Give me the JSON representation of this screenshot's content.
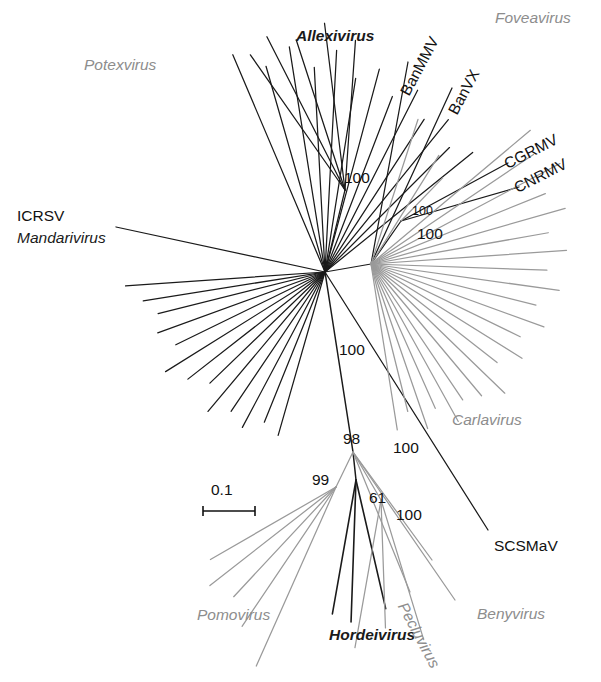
{
  "figure": {
    "type": "unrooted-phylogenetic-tree",
    "background_color": "#ffffff",
    "black_color": "#1a1a1a",
    "gray_color": "#9a9a9a"
  },
  "scale_bar": {
    "label": "0.1",
    "length_px": 52
  },
  "genus_labels": [
    {
      "text": "Potexvirus",
      "color": "#8d8d8d",
      "x": 84,
      "y": 57,
      "style": "italic-gray"
    },
    {
      "text": "Allexivirus",
      "color": "#1a1a1a",
      "x": 296,
      "y": 28,
      "style": "italic-black"
    },
    {
      "text": "Foveavirus",
      "color": "#8d8d8d",
      "x": 495,
      "y": 10,
      "style": "italic-gray"
    },
    {
      "text": "Mandarivirus",
      "color": "#1a1a1a",
      "x": 17,
      "y": 234,
      "style": "italic-black"
    },
    {
      "text": "Carlavirus",
      "color": "#8d8d8d",
      "x": 452,
      "y": 415,
      "style": "italic-gray"
    },
    {
      "text": "Pomovirus",
      "color": "#8d8d8d",
      "x": 197,
      "y": 609,
      "style": "italic-gray"
    },
    {
      "text": "Hordeivirus",
      "color": "#1a1a1a",
      "x": 329,
      "y": 629,
      "style": "italic-black"
    },
    {
      "text": "Pecluvirus",
      "color": "#8d8d8d",
      "x": 417,
      "y": 607,
      "style": "italic-gray-rot"
    },
    {
      "text": "Benyvirus",
      "color": "#8d8d8d",
      "x": 484,
      "y": 608,
      "style": "italic-gray"
    }
  ],
  "species_labels": [
    {
      "text": "BanMMV",
      "x": 416,
      "y": 82,
      "rotated": true
    },
    {
      "text": "BanVX",
      "x": 462,
      "y": 103,
      "rotated": true
    },
    {
      "text": "CGRMV",
      "x": 511,
      "y": 157,
      "rotated": true
    },
    {
      "text": "CNRMV",
      "x": 521,
      "y": 180,
      "rotated": true
    },
    {
      "text": "ICRSV",
      "x": 17,
      "y": 213,
      "rotated": false
    },
    {
      "text": "SCSMaV",
      "x": 494,
      "y": 541,
      "rotated": false
    }
  ],
  "bootstrap_values": [
    {
      "value": "100",
      "x": 344,
      "y": 170,
      "size": "normal"
    },
    {
      "value": "100",
      "x": 412,
      "y": 205,
      "size": "small"
    },
    {
      "value": "100",
      "x": 417,
      "y": 228,
      "size": "normal"
    },
    {
      "value": "100",
      "x": 339,
      "y": 344,
      "size": "normal"
    },
    {
      "value": "98",
      "x": 345,
      "y": 433,
      "size": "normal"
    },
    {
      "value": "100",
      "x": 395,
      "y": 442,
      "size": "normal"
    },
    {
      "value": "99",
      "x": 314,
      "y": 474,
      "size": "normal"
    },
    {
      "value": "61",
      "x": 371,
      "y": 492,
      "size": "normal"
    },
    {
      "value": "100",
      "x": 398,
      "y": 509,
      "size": "normal"
    }
  ],
  "tree_topology": {
    "nodes": {
      "hub_left": {
        "x": 325,
        "y": 272,
        "desc": "potex-allexi-mandari hub"
      },
      "hub_right": {
        "x": 371,
        "y": 264,
        "desc": "carla-foveavirus hub"
      },
      "fove_node": {
        "x": 401,
        "y": 221,
        "desc": "foveavirus CGRMV/CNRMV node"
      },
      "allexi_node": {
        "x": 345,
        "y": 190,
        "desc": "allexivirus node"
      },
      "lower_node": {
        "x": 353,
        "y": 452,
        "desc": "rod-shaped virus node (98)"
      },
      "pomo_node": {
        "x": 336,
        "y": 487,
        "desc": "pomovirus node (99)"
      },
      "horde_node": {
        "x": 356,
        "y": 480,
        "desc": "hordeivirus node (61)"
      },
      "peclu_node": {
        "x": 381,
        "y": 500,
        "desc": "pecluvirus node (100)"
      }
    },
    "branches": {
      "potexvirus_count": 26,
      "allexivirus_count": 5,
      "mandarivirus_count": 1,
      "foveavirus_count": 6,
      "carlavirus_count": 22,
      "pomovirus_count": 5,
      "hordeivirus_count": 3,
      "pecluvirus_count": 3,
      "benyvirus_count": 3,
      "scsmav_count": 1
    }
  }
}
